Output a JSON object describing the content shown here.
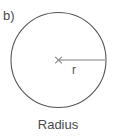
{
  "figure": {
    "part_label": "b)",
    "caption": "Radius",
    "radius_label": "r",
    "center_marker": "times-marker",
    "background_color": "#ffffff",
    "circle_stroke_color": "#555555",
    "radius_line_color": "#a8a8a8",
    "text_color": "#4a4a4a",
    "geometry": {
      "center_x": 58.5,
      "center_y": 60,
      "radius": 47.5,
      "radius_line_start_x": 59,
      "radius_line_end_x": 106,
      "radius_line_y": 60
    }
  }
}
